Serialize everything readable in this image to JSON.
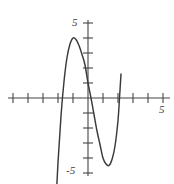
{
  "figure": {
    "title": "",
    "background_color": "#ffffff",
    "axis_color": "#444444",
    "curve_color": "#3a3a3a"
  },
  "labels": {
    "y_top": "5",
    "y_bottom": "-5",
    "x_right": "5"
  },
  "chart_data": {
    "type": "line",
    "title": "",
    "xlabel": "",
    "ylabel": "",
    "xlim": [
      -5,
      5.5
    ],
    "ylim": [
      -5.5,
      5.5
    ],
    "grid": false,
    "legend": "none",
    "x_ticks": [
      -5,
      -4,
      -3,
      -2,
      -1,
      1,
      2,
      3,
      4,
      5
    ],
    "y_ticks": [
      -5,
      -4,
      -3,
      -2,
      -1,
      1,
      2,
      3,
      4,
      5
    ],
    "x_tick_labels": [
      "5"
    ],
    "y_tick_labels": [
      "5",
      "-5"
    ],
    "annotations": [
      {
        "text": "5",
        "axis": "y",
        "value": 5
      },
      {
        "text": "-5",
        "axis": "y",
        "value": -5
      },
      {
        "text": "5",
        "axis": "x",
        "value": 5
      }
    ],
    "series": [
      {
        "name": "cubic",
        "expression": "y = 2x^3 - x^2 - 6x + 1",
        "local_maximum": {
          "x": -1.0,
          "y": 2.2
        },
        "local_minimum": {
          "x": 1.1,
          "y": -4.0
        },
        "roots": [
          -1.85,
          0.17,
          1.95
        ],
        "y_intercept": 1.0,
        "x": [
          -2.75,
          -2.6,
          -2.4,
          -2.2,
          -2.0,
          -1.8,
          -1.6,
          -1.4,
          -1.2,
          -1.0,
          -0.8,
          -0.6,
          -0.4,
          -0.2,
          0.0,
          0.2,
          0.4,
          0.6,
          0.8,
          1.0,
          1.2,
          1.4,
          1.6,
          1.8,
          2.0,
          2.1,
          2.2
        ],
        "y": [
          -24.1,
          -18.5,
          -13.0,
          -8.2,
          -4.3,
          -1.2,
          1.1,
          2.7,
          3.6,
          4.0,
          3.9,
          3.5,
          2.9,
          2.2,
          1.0,
          0.0,
          -1.1,
          -2.2,
          -3.1,
          -4.0,
          -4.4,
          -4.5,
          -4.1,
          -3.2,
          -1.5,
          0.0,
          1.6
        ]
      }
    ]
  }
}
